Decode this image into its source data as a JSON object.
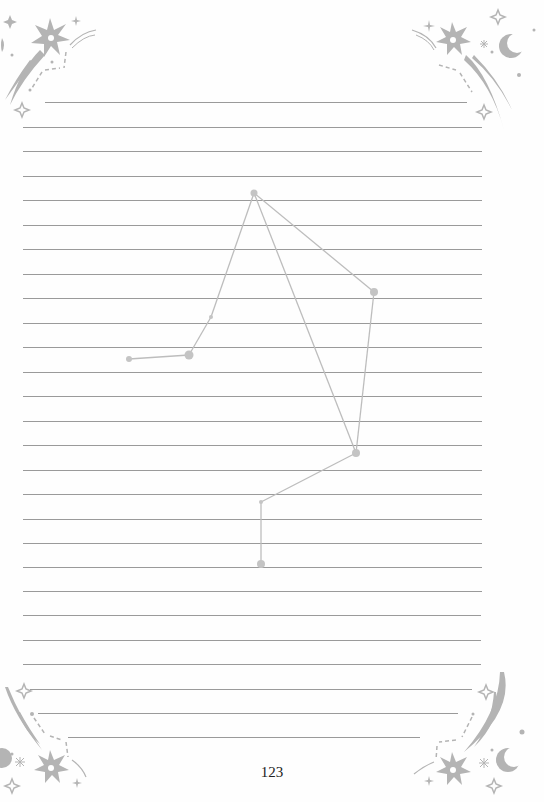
{
  "page": {
    "number": "123",
    "colors": {
      "line": "#9a9a9a",
      "ornament": "#b4b4b4",
      "constellation_line": "#bdbdbd",
      "constellation_star": "#c4c4c4"
    }
  },
  "ruled_lines": [
    {
      "y": 102,
      "x1": 45,
      "x2": 467
    },
    {
      "y": 127,
      "x1": 23,
      "x2": 482
    },
    {
      "y": 151,
      "x1": 23,
      "x2": 482
    },
    {
      "y": 176,
      "x1": 23,
      "x2": 482
    },
    {
      "y": 200,
      "x1": 23,
      "x2": 482
    },
    {
      "y": 225,
      "x1": 23,
      "x2": 482
    },
    {
      "y": 249,
      "x1": 23,
      "x2": 482
    },
    {
      "y": 274,
      "x1": 23,
      "x2": 482
    },
    {
      "y": 298,
      "x1": 23,
      "x2": 482
    },
    {
      "y": 323,
      "x1": 23,
      "x2": 482
    },
    {
      "y": 347,
      "x1": 23,
      "x2": 482
    },
    {
      "y": 372,
      "x1": 23,
      "x2": 482
    },
    {
      "y": 396,
      "x1": 23,
      "x2": 482
    },
    {
      "y": 421,
      "x1": 23,
      "x2": 482
    },
    {
      "y": 445,
      "x1": 23,
      "x2": 482
    },
    {
      "y": 470,
      "x1": 23,
      "x2": 482
    },
    {
      "y": 494,
      "x1": 23,
      "x2": 482
    },
    {
      "y": 519,
      "x1": 23,
      "x2": 482
    },
    {
      "y": 543,
      "x1": 23,
      "x2": 482
    },
    {
      "y": 567,
      "x1": 23,
      "x2": 482
    },
    {
      "y": 591,
      "x1": 23,
      "x2": 482
    },
    {
      "y": 615,
      "x1": 23,
      "x2": 481
    },
    {
      "y": 640,
      "x1": 23,
      "x2": 481
    },
    {
      "y": 664,
      "x1": 23,
      "x2": 481
    },
    {
      "y": 689,
      "x1": 30,
      "x2": 472
    },
    {
      "y": 713,
      "x1": 38,
      "x2": 458
    },
    {
      "y": 737,
      "x1": 68,
      "x2": 420
    }
  ],
  "constellation": {
    "name": "libra",
    "stars": [
      {
        "x": 129,
        "y": 359,
        "r": 3
      },
      {
        "x": 189,
        "y": 355,
        "r": 4.5
      },
      {
        "x": 211,
        "y": 317,
        "r": 2
      },
      {
        "x": 254,
        "y": 193,
        "r": 3.5
      },
      {
        "x": 374,
        "y": 292,
        "r": 4
      },
      {
        "x": 356,
        "y": 453,
        "r": 4
      },
      {
        "x": 261,
        "y": 502,
        "r": 2
      },
      {
        "x": 261,
        "y": 564,
        "r": 4
      }
    ],
    "edges": [
      [
        0,
        1
      ],
      [
        1,
        2
      ],
      [
        2,
        3
      ],
      [
        3,
        4
      ],
      [
        3,
        5
      ],
      [
        4,
        5
      ],
      [
        5,
        6
      ],
      [
        6,
        7
      ]
    ]
  },
  "ornaments": [
    {
      "corner": "top-left",
      "icon": "shooting-star-icon"
    },
    {
      "corner": "top-right",
      "icon": "shooting-star-moon-icon"
    },
    {
      "corner": "bottom-left",
      "icon": "shooting-star-icon"
    },
    {
      "corner": "bottom-right",
      "icon": "shooting-star-moon-icon"
    }
  ]
}
